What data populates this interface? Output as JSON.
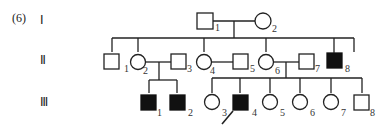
{
  "problem_label": "(6)",
  "generations": [
    "Ⅰ",
    "Ⅱ",
    "Ⅲ"
  ],
  "colors": {
    "line": "#222222",
    "affected": "#111111",
    "unaffected": "#ffffff"
  },
  "legend": {
    "square": "male",
    "circle": "female",
    "filled": "affected",
    "arrow": "proband"
  },
  "individuals": {
    "I": [
      {
        "id": "1",
        "sex": "male",
        "affected": false
      },
      {
        "id": "2",
        "sex": "female",
        "affected": false
      }
    ],
    "II": [
      {
        "id": "1",
        "sex": "male",
        "affected": false
      },
      {
        "id": "2",
        "sex": "female",
        "affected": false
      },
      {
        "id": "3",
        "sex": "male",
        "affected": false
      },
      {
        "id": "4",
        "sex": "female",
        "affected": false
      },
      {
        "id": "5",
        "sex": "male",
        "affected": false
      },
      {
        "id": "6",
        "sex": "female",
        "affected": false
      },
      {
        "id": "7",
        "sex": "male",
        "affected": false
      },
      {
        "id": "8",
        "sex": "male",
        "affected": true
      }
    ],
    "III": [
      {
        "id": "1",
        "sex": "male",
        "affected": true
      },
      {
        "id": "2",
        "sex": "male",
        "affected": true
      },
      {
        "id": "3",
        "sex": "female",
        "affected": false
      },
      {
        "id": "4",
        "sex": "male",
        "affected": true,
        "proband": true
      },
      {
        "id": "5",
        "sex": "female",
        "affected": false
      },
      {
        "id": "6",
        "sex": "female",
        "affected": false
      },
      {
        "id": "7",
        "sex": "female",
        "affected": false
      },
      {
        "id": "8",
        "sex": "male",
        "affected": false
      }
    ]
  }
}
